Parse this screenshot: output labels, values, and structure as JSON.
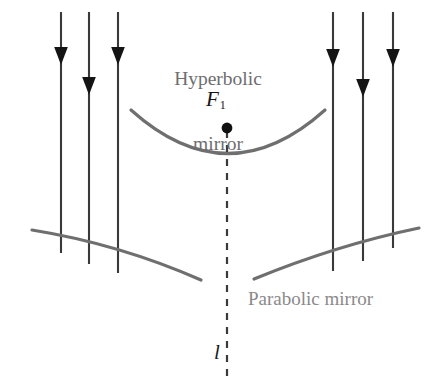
{
  "figure": {
    "width": 436,
    "height": 382,
    "background": "#ffffff"
  },
  "labels": {
    "hyperbolic_mirror_line1": "Hyperbolic",
    "hyperbolic_mirror_line2": "mirror",
    "parabolic_mirror": "Parabolic mirror",
    "focus_letter": "F",
    "focus_subscript": "1",
    "axis_letter": "l"
  },
  "colors": {
    "mirror_stroke": "#6f6f6f",
    "ray_stroke": "#3a3a3a",
    "dash_stroke": "#3a3a3a",
    "focus_dot": "#111111",
    "label_gray": "#7d7d7d",
    "label_dark": "#151515",
    "background": "#ffffff"
  },
  "geometry": {
    "hyperbolic_mirror": {
      "name": "hyperbolic-mirror-curve",
      "shape": "concave-up-arc",
      "left_end": [
        131,
        110
      ],
      "vertex": [
        228,
        160
      ],
      "right_end": [
        325,
        110
      ],
      "stroke_width": 3.2
    },
    "parabolic_mirror_left": {
      "name": "parabolic-mirror-left-segment",
      "left_end": [
        32,
        230
      ],
      "right_end": [
        201,
        280
      ],
      "stroke_width": 3.2
    },
    "parabolic_mirror_right": {
      "name": "parabolic-mirror-right-segment",
      "left_end": [
        254,
        279
      ],
      "right_end": [
        419,
        228
      ],
      "stroke_width": 3.2
    },
    "optical_axis": {
      "name": "optical-axis-dashed-line",
      "x": 227,
      "y_top": 131,
      "y_bottom": 378,
      "dash_pattern": "7 7"
    },
    "focus_point": {
      "name": "focus-F1-dot",
      "x": 227,
      "y": 128,
      "radius": 5.4
    },
    "rays": [
      {
        "id": "ray-left-1",
        "x": 61,
        "y_top": 12,
        "y_bottom": 253,
        "arrow_y": 58
      },
      {
        "id": "ray-left-2",
        "x": 89,
        "y_top": 12,
        "y_bottom": 264,
        "arrow_y": 88
      },
      {
        "id": "ray-left-3",
        "x": 118,
        "y_top": 12,
        "y_bottom": 273,
        "arrow_y": 58
      },
      {
        "id": "ray-right-1",
        "x": 333,
        "y_top": 12,
        "y_bottom": 271,
        "arrow_y": 60
      },
      {
        "id": "ray-right-2",
        "x": 363,
        "y_top": 12,
        "y_bottom": 261,
        "arrow_y": 90
      },
      {
        "id": "ray-right-3",
        "x": 393,
        "y_top": 12,
        "y_bottom": 248,
        "arrow_y": 60
      }
    ]
  }
}
